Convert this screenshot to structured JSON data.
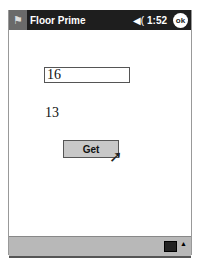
{
  "titlebar": {
    "app_title": "Floor Prime",
    "start_icon": "windows-flag-icon",
    "volume_icon": "speaker-icon",
    "speaker_glyph": "◀(",
    "time": "1:52",
    "ok_label": "ok"
  },
  "form": {
    "input_value": "16",
    "result_value": "13",
    "get_button_label": "Get"
  },
  "taskbar": {
    "keyboard_icon": "keyboard-icon",
    "arrow_glyph": "▲"
  }
}
